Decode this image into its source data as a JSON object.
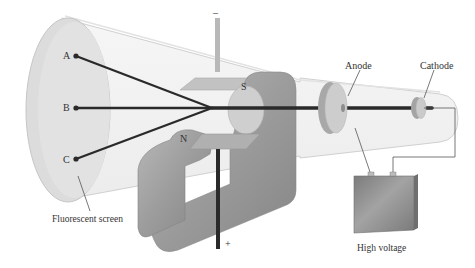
{
  "diagram": {
    "labels": {
      "point_a": "A",
      "point_b": "B",
      "point_c": "C",
      "magnet_south": "S",
      "magnet_north": "N",
      "plate_top_sign": "–",
      "plate_bottom_sign": "+",
      "anode": "Anode",
      "cathode": "Cathode",
      "screen": "Fluorescent screen",
      "power": "High voltage"
    },
    "colors": {
      "tube_glass": "#f2f2f2",
      "screen": "#d9d9d9",
      "magnet": "#9a9a9a",
      "plate": "#b5b5b5",
      "beam": "#2a2a2a",
      "battery": "#8c8c8c",
      "wire": "#555555"
    }
  }
}
